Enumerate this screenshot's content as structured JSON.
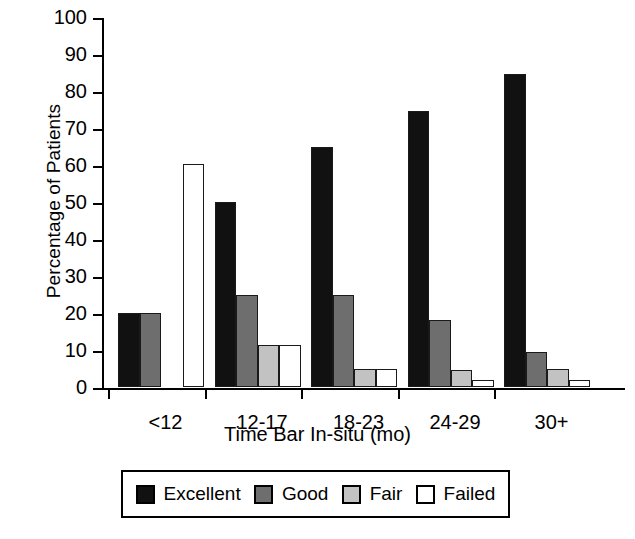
{
  "chart_data": {
    "type": "bar",
    "title": "",
    "xlabel": "Time Bar In-situ (mo)",
    "ylabel": "Percentage of Patients",
    "categories": [
      "<12",
      "12-17",
      "18-23",
      "24-29",
      "30+"
    ],
    "series": [
      {
        "name": "Excellent",
        "color": "#111111",
        "values": [
          20,
          50,
          65,
          74.5,
          84.5
        ]
      },
      {
        "name": "Good",
        "color": "#6e6e6e",
        "values": [
          20,
          24.8,
          24.8,
          18,
          9.5
        ]
      },
      {
        "name": "Fair",
        "color": "#c2c2c2",
        "values": [
          0,
          11.4,
          5,
          4.5,
          5
        ]
      },
      {
        "name": "Failed",
        "color": "#ffffff",
        "values": [
          60.3,
          11.4,
          5,
          2,
          2
        ]
      }
    ],
    "ylim": [
      0,
      100
    ],
    "yticks": [
      0,
      10,
      20,
      30,
      40,
      50,
      60,
      70,
      80,
      90,
      100
    ],
    "ytick_labels": [
      "0",
      "10",
      "20",
      "30",
      "40",
      "50",
      "60",
      "70",
      "80",
      "90",
      "100"
    ],
    "grid": false,
    "legend_position": "bottom",
    "legend_entries": [
      "Excellent",
      "Good",
      "Fair",
      "Failed"
    ]
  }
}
